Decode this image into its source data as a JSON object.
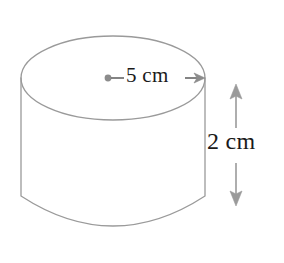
{
  "figure": {
    "name": "cylinder-diagram",
    "shape": "cylinder",
    "background_color": "#ffffff",
    "outline_color": "#9a9a9a",
    "annotation_color": "#8c8c8c",
    "text_color": "#1a1a1a"
  },
  "labels": {
    "radius": "5 cm",
    "height": "2 cm"
  },
  "measurements": {
    "radius_value": "5",
    "radius_unit": "cm",
    "height_value": "2",
    "height_unit": "cm"
  },
  "geometry": {
    "top_ellipse": {
      "cx": 113,
      "cy": 78,
      "rx": 92,
      "ry": 42
    },
    "body_left_x": 21,
    "body_right_x": 205,
    "body_top_y": 78,
    "body_bottom_y": 196,
    "bottom_arc_sag_y": 238,
    "radius_dot": {
      "cx": 108,
      "cy": 78,
      "r": 3.4
    },
    "radius_arrow": {
      "x1": 108,
      "x2": 205,
      "y": 78
    },
    "height_arrow": {
      "x": 236,
      "y_top": 85,
      "y_bottom": 205
    }
  },
  "icons": {
    "center_point": "center-dot-icon",
    "radius_arrow": "arrow-right-icon",
    "height_arrow": "arrow-updown-icon"
  }
}
